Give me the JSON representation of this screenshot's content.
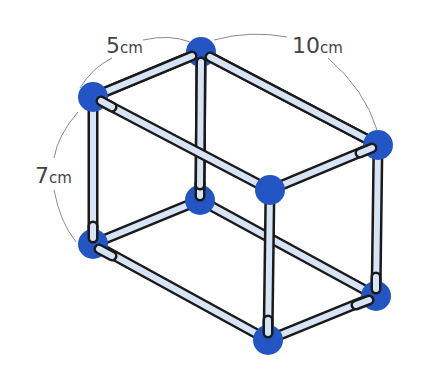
{
  "figure": {
    "type": "rectangular-prism-wireframe",
    "colors": {
      "background": "#ffffff",
      "vertex": "#2455c4",
      "rod_fill": "#d6e4f5",
      "rod_outline": "#1a1a1a",
      "dimension_arc": "#8a8a8a",
      "label_text": "#444444"
    },
    "vertices": [
      {
        "id": "A",
        "name": "top-back-left",
        "x": 201,
        "y": 52
      },
      {
        "id": "B",
        "name": "top-front-left",
        "x": 93,
        "y": 97
      },
      {
        "id": "C",
        "name": "top-back-right",
        "x": 378,
        "y": 145
      },
      {
        "id": "D",
        "name": "top-front-right",
        "x": 270,
        "y": 190
      },
      {
        "id": "E",
        "name": "bottom-back-left",
        "x": 200,
        "y": 200
      },
      {
        "id": "F",
        "name": "bottom-front-left",
        "x": 93,
        "y": 244
      },
      {
        "id": "G",
        "name": "bottom-back-right",
        "x": 376,
        "y": 296
      },
      {
        "id": "H",
        "name": "bottom-front-right",
        "x": 268,
        "y": 340
      }
    ],
    "dimensions": [
      {
        "id": "width",
        "number": "5",
        "unit": "cm",
        "edge": "A-B"
      },
      {
        "id": "height",
        "number": "7",
        "unit": "cm",
        "edge": "B-F"
      },
      {
        "id": "length",
        "number": "10",
        "unit": "cm",
        "edge": "A-C"
      }
    ]
  }
}
